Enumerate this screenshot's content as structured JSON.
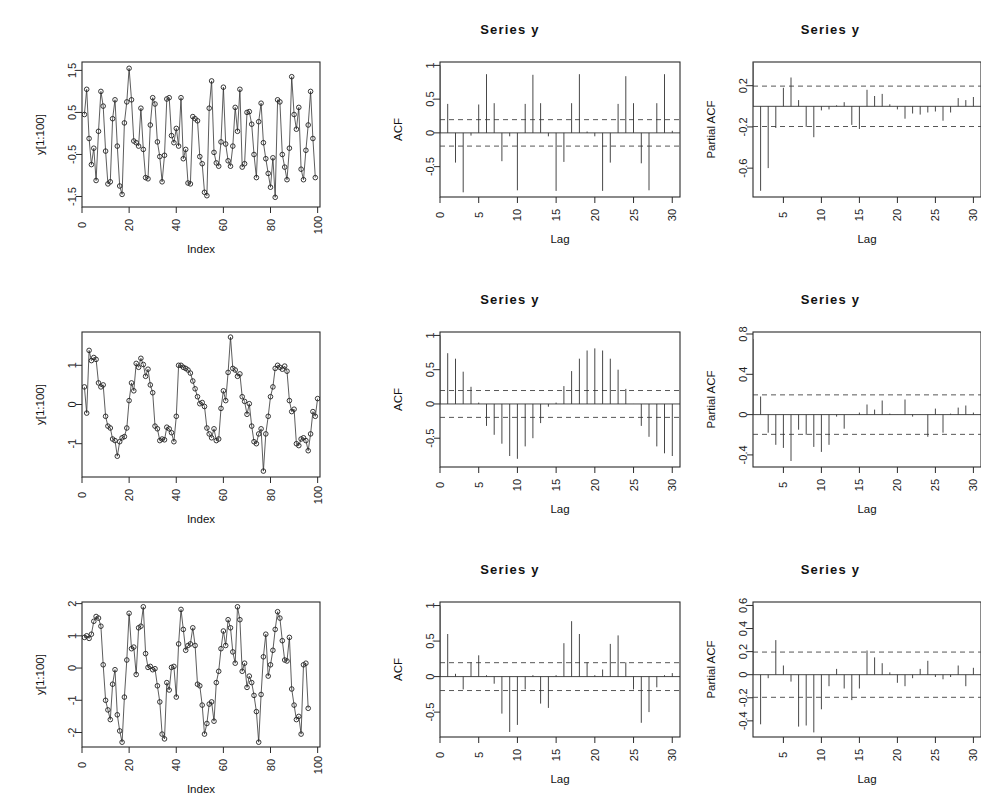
{
  "figure": {
    "layout": "3x3 grid of R base-graphics diagnostic plots",
    "rows": 3,
    "columns": 3,
    "column_roles": [
      "time series",
      "ACF",
      "Partial ACF"
    ]
  },
  "labels": {
    "series_title": "Series  y",
    "xlab_index": "Index",
    "xlab_lag": "Lag",
    "ylab_series": "y[1:100]",
    "ylab_acf": "ACF",
    "ylab_pacf": "Partial ACF"
  },
  "colors": {
    "ink": "#2b2b2b",
    "line": "#333333",
    "confidence": "#444444",
    "background": "#ffffff"
  },
  "chart_data": [
    {
      "id": "row1-series",
      "type": "line",
      "title": "",
      "xlabel": "Index",
      "ylabel": "y[1:100]",
      "xlim": [
        0,
        101
      ],
      "ylim": [
        -1.75,
        1.7
      ],
      "xticks": [
        0,
        20,
        40,
        60,
        80,
        100
      ],
      "yticks": [
        -1.5,
        -0.5,
        0.5,
        1.5
      ],
      "grid": false,
      "markers": "open-circle",
      "x": [
        1,
        2,
        3,
        4,
        5,
        6,
        7,
        8,
        9,
        10,
        11,
        12,
        13,
        14,
        15,
        16,
        17,
        18,
        19,
        20,
        21,
        22,
        23,
        24,
        25,
        26,
        27,
        28,
        29,
        30,
        31,
        32,
        33,
        34,
        35,
        36,
        37,
        38,
        39,
        40,
        41,
        42,
        43,
        44,
        45,
        46,
        47,
        48,
        49,
        50,
        51,
        52,
        53,
        54,
        55,
        56,
        57,
        58,
        59,
        60,
        61,
        62,
        63,
        64,
        65,
        66,
        67,
        68,
        69,
        70,
        71,
        72,
        73,
        74,
        75,
        76,
        77,
        78,
        79,
        80,
        81,
        82,
        83,
        84,
        85,
        86,
        87,
        88,
        89,
        90,
        91,
        92,
        93,
        94,
        95,
        96,
        97,
        98,
        99,
        100
      ],
      "values": [
        0.45,
        1.05,
        -0.12,
        -0.74,
        -0.35,
        -1.12,
        0.05,
        1.0,
        0.65,
        -0.42,
        -1.2,
        -1.15,
        0.35,
        0.8,
        -0.3,
        -1.25,
        -1.45,
        0.25,
        0.75,
        1.55,
        0.8,
        -0.18,
        -0.22,
        -0.3,
        0.6,
        -0.38,
        -1.05,
        -1.08,
        0.2,
        0.85,
        0.7,
        -0.2,
        -0.55,
        -1.15,
        -0.52,
        0.82,
        0.85,
        -0.05,
        -0.22,
        0.12,
        -0.3,
        0.85,
        -0.6,
        -0.38,
        -1.18,
        -1.2,
        0.4,
        0.35,
        0.3,
        -0.55,
        -0.72,
        -1.4,
        -1.48,
        0.6,
        1.25,
        -0.45,
        -0.7,
        -0.78,
        -0.2,
        1.1,
        -0.25,
        -0.65,
        -0.78,
        -0.3,
        0.62,
        0.05,
        1.05,
        -0.8,
        -0.72,
        0.5,
        0.52,
        0.22,
        -0.5,
        -1.05,
        0.28,
        0.72,
        -0.22,
        -0.6,
        -0.95,
        -1.28,
        -0.58,
        -1.52,
        0.8,
        0.75,
        -0.5,
        -0.8,
        -1.1,
        -0.35,
        1.35,
        0.45,
        0.1,
        0.62,
        -0.85,
        -1.1,
        -0.4,
        0.2,
        1.0,
        -0.12,
        -1.05
      ]
    },
    {
      "id": "row1-acf",
      "type": "bar",
      "title": "Series  y",
      "xlabel": "Lag",
      "ylabel": "ACF",
      "xlim": [
        0,
        31
      ],
      "ylim": [
        -0.95,
        1.05
      ],
      "xticks": [
        0,
        5,
        10,
        15,
        20,
        25,
        30
      ],
      "yticks": [
        -0.5,
        0.0,
        0.5,
        1.0
      ],
      "conf_bounds": [
        0.196,
        -0.196
      ],
      "lags": [
        0,
        1,
        2,
        3,
        4,
        5,
        6,
        7,
        8,
        9,
        10,
        11,
        12,
        13,
        14,
        15,
        16,
        17,
        18,
        19,
        20,
        21,
        22,
        23,
        24,
        25,
        26,
        27,
        28,
        29,
        30
      ],
      "values": [
        1.0,
        0.43,
        -0.44,
        -0.88,
        -0.04,
        0.42,
        0.87,
        0.44,
        -0.42,
        -0.05,
        -0.85,
        0.43,
        0.86,
        0.44,
        -0.05,
        -0.86,
        -0.43,
        0.44,
        0.87,
        0.02,
        -0.05,
        -0.86,
        -0.44,
        0.43,
        0.84,
        0.44,
        -0.45,
        -0.85,
        0.44,
        0.87,
        0.03
      ]
    },
    {
      "id": "row1-pacf",
      "type": "bar",
      "title": "Series  y",
      "xlabel": "Lag",
      "ylabel": "Partial ACF",
      "xlim": [
        1,
        31
      ],
      "ylim": [
        -0.88,
        0.43
      ],
      "xticks": [
        0,
        5,
        10,
        15,
        20,
        25,
        30
      ],
      "yticks": [
        -0.6,
        -0.2,
        0.2
      ],
      "conf_bounds": [
        0.196,
        -0.196
      ],
      "lags": [
        1,
        2,
        3,
        4,
        5,
        6,
        7,
        8,
        9,
        10,
        11,
        12,
        13,
        14,
        15,
        16,
        17,
        18,
        19,
        20,
        21,
        22,
        23,
        24,
        25,
        26,
        27,
        28,
        29,
        30
      ],
      "values": [
        0.42,
        -0.82,
        -0.6,
        -0.21,
        0.18,
        0.28,
        0.06,
        -0.2,
        -0.3,
        -0.04,
        -0.03,
        0.01,
        0.04,
        -0.18,
        -0.22,
        0.16,
        0.1,
        0.12,
        0.02,
        -0.03,
        -0.12,
        -0.07,
        -0.08,
        -0.06,
        -0.05,
        -0.14,
        -0.06,
        0.08,
        0.06,
        0.09
      ]
    },
    {
      "id": "row2-series",
      "type": "line",
      "title": "",
      "xlabel": "Index",
      "ylabel": "y[1:100]",
      "xlim": [
        0,
        101
      ],
      "ylim": [
        -1.85,
        1.85
      ],
      "xticks": [
        0,
        20,
        40,
        60,
        80,
        100
      ],
      "yticks": [
        -1,
        0,
        1
      ],
      "grid": false,
      "markers": "open-circle",
      "x": [
        1,
        2,
        3,
        4,
        5,
        6,
        7,
        8,
        9,
        10,
        11,
        12,
        13,
        14,
        15,
        16,
        17,
        18,
        19,
        20,
        21,
        22,
        23,
        24,
        25,
        26,
        27,
        28,
        29,
        30,
        31,
        32,
        33,
        34,
        35,
        36,
        37,
        38,
        39,
        40,
        41,
        42,
        43,
        44,
        45,
        46,
        47,
        48,
        49,
        50,
        51,
        52,
        53,
        54,
        55,
        56,
        57,
        58,
        59,
        60,
        61,
        62,
        63,
        64,
        65,
        66,
        67,
        68,
        69,
        70,
        71,
        72,
        73,
        74,
        75,
        76,
        77,
        78,
        79,
        80,
        81,
        82,
        83,
        84,
        85,
        86,
        87,
        88,
        89,
        90,
        91,
        92,
        93,
        94,
        95,
        96,
        97,
        98,
        99,
        100
      ],
      "values": [
        0.45,
        -0.22,
        1.38,
        1.12,
        1.2,
        1.15,
        0.55,
        0.45,
        0.5,
        -0.3,
        -0.55,
        -0.6,
        -0.88,
        -0.92,
        -1.32,
        -0.95,
        -0.85,
        -0.82,
        -0.6,
        0.1,
        0.55,
        0.35,
        1.05,
        0.95,
        1.18,
        1.02,
        0.72,
        0.9,
        0.5,
        0.3,
        -0.55,
        -0.62,
        -0.92,
        -0.88,
        -0.9,
        -0.58,
        -0.62,
        -0.72,
        -0.95,
        -0.3,
        1.0,
        1.0,
        0.95,
        0.92,
        0.88,
        0.8,
        0.6,
        0.4,
        0.2,
        0.02,
        0.05,
        -0.05,
        -0.6,
        -0.75,
        -0.85,
        -0.62,
        -0.92,
        -0.88,
        -0.1,
        0.35,
        0.1,
        0.82,
        1.72,
        0.92,
        0.88,
        0.72,
        0.78,
        0.2,
        0.08,
        -0.25,
        0.02,
        -0.55,
        -0.95,
        -1.0,
        -0.75,
        -0.62,
        -1.7,
        -0.75,
        -0.3,
        0.2,
        0.45,
        0.92,
        1.0,
        0.95,
        0.9,
        0.98,
        0.85,
        0.1,
        -0.18,
        -0.12,
        -1.0,
        -1.05,
        -0.88,
        -0.85,
        -0.92,
        -1.18,
        -0.75,
        -0.18,
        -0.3,
        0.15
      ]
    },
    {
      "id": "row2-acf",
      "type": "bar",
      "title": "Series  y",
      "xlabel": "Lag",
      "ylabel": "ACF",
      "xlim": [
        0,
        31
      ],
      "ylim": [
        -0.92,
        1.05
      ],
      "xticks": [
        0,
        5,
        10,
        15,
        20,
        25,
        30
      ],
      "yticks": [
        -0.5,
        0.0,
        0.5,
        1.0
      ],
      "conf_bounds": [
        0.196,
        -0.196
      ],
      "lags": [
        0,
        1,
        2,
        3,
        4,
        5,
        6,
        7,
        8,
        9,
        10,
        11,
        12,
        13,
        14,
        15,
        16,
        17,
        18,
        19,
        20,
        21,
        22,
        23,
        24,
        25,
        26,
        27,
        28,
        29,
        30
      ],
      "values": [
        1.0,
        0.74,
        0.66,
        0.47,
        0.25,
        0.02,
        -0.32,
        -0.45,
        -0.58,
        -0.76,
        -0.8,
        -0.62,
        -0.5,
        -0.28,
        -0.04,
        0.02,
        0.26,
        0.48,
        0.66,
        0.78,
        0.81,
        0.78,
        0.66,
        0.5,
        0.22,
        0.0,
        -0.32,
        -0.48,
        -0.62,
        -0.72,
        -0.76
      ]
    },
    {
      "id": "row2-pacf",
      "type": "bar",
      "title": "Series  y",
      "xlabel": "Lag",
      "ylabel": "Partial ACF",
      "xlim": [
        1,
        31
      ],
      "ylim": [
        -0.52,
        0.82
      ],
      "xticks": [
        0,
        5,
        10,
        15,
        20,
        25,
        30
      ],
      "yticks": [
        -0.4,
        0.0,
        0.4,
        0.8
      ],
      "conf_bounds": [
        0.196,
        -0.196
      ],
      "lags": [
        1,
        2,
        3,
        4,
        5,
        6,
        7,
        8,
        9,
        10,
        11,
        12,
        13,
        14,
        15,
        16,
        17,
        18,
        19,
        20,
        21,
        22,
        23,
        24,
        25,
        26,
        27,
        28,
        29,
        30
      ],
      "values": [
        0.75,
        0.18,
        -0.18,
        -0.3,
        -0.33,
        -0.46,
        -0.15,
        -0.2,
        -0.32,
        -0.37,
        -0.3,
        -0.02,
        -0.14,
        0.0,
        0.02,
        0.1,
        0.05,
        0.14,
        0.01,
        0.0,
        0.15,
        -0.02,
        0.0,
        -0.22,
        0.06,
        -0.18,
        0.01,
        0.07,
        0.09,
        0.02
      ]
    },
    {
      "id": "row3-series",
      "type": "line",
      "title": "",
      "xlabel": "Index",
      "ylabel": "y[1:100]",
      "xlim": [
        0,
        101
      ],
      "ylim": [
        -2.45,
        2.05
      ],
      "xticks": [
        0,
        20,
        40,
        60,
        80,
        100
      ],
      "yticks": [
        -2,
        -1,
        0,
        1,
        2
      ],
      "grid": false,
      "markers": "open-circle",
      "x": [
        1,
        2,
        3,
        4,
        5,
        6,
        7,
        8,
        9,
        10,
        11,
        12,
        13,
        14,
        15,
        16,
        17,
        18,
        19,
        20,
        21,
        22,
        23,
        24,
        25,
        26,
        27,
        28,
        29,
        30,
        31,
        32,
        33,
        34,
        35,
        36,
        37,
        38,
        39,
        40,
        41,
        42,
        43,
        44,
        45,
        46,
        47,
        48,
        49,
        50,
        51,
        52,
        53,
        54,
        55,
        56,
        57,
        58,
        59,
        60,
        61,
        62,
        63,
        64,
        65,
        66,
        67,
        68,
        69,
        70,
        71,
        72,
        73,
        74,
        75,
        76,
        77,
        78,
        79,
        80,
        81,
        82,
        83,
        84,
        85,
        86,
        87,
        88,
        89,
        90,
        91,
        92,
        93,
        94,
        95,
        96,
        97,
        98,
        99,
        100
      ],
      "values": [
        0.95,
        1.0,
        0.92,
        1.05,
        1.45,
        1.6,
        1.55,
        1.3,
        0.1,
        -1.0,
        -1.3,
        -1.6,
        -0.5,
        -0.05,
        -1.45,
        -1.95,
        -2.3,
        -0.9,
        0.25,
        1.7,
        0.6,
        0.65,
        -0.2,
        1.25,
        1.3,
        1.9,
        0.45,
        0.02,
        0.05,
        -0.05,
        -0.02,
        -0.55,
        -1.05,
        -2.05,
        -2.2,
        -0.45,
        -0.68,
        0.02,
        0.05,
        -0.9,
        0.75,
        1.82,
        1.2,
        0.55,
        0.7,
        0.75,
        1.25,
        0.7,
        -0.5,
        -0.55,
        -1.15,
        -2.05,
        -1.72,
        -1.12,
        -1.05,
        -1.65,
        -0.45,
        -0.1,
        0.6,
        1.15,
        0.7,
        1.5,
        1.25,
        0.5,
        0.15,
        1.9,
        1.5,
        -0.1,
        0.15,
        -0.6,
        -0.25,
        -0.45,
        -0.85,
        -1.35,
        -2.3,
        -0.82,
        0.35,
        1.05,
        -0.25,
        0.1,
        0.55,
        1.2,
        1.75,
        1.55,
        0.85,
        0.25,
        0.22,
        0.95,
        -0.65,
        -1.15,
        -1.6,
        -1.5,
        -2.05,
        0.1,
        0.15,
        -1.25
      ]
    },
    {
      "id": "row3-acf",
      "type": "bar",
      "title": "Series  y",
      "xlabel": "Lag",
      "ylabel": "ACF",
      "xlim": [
        0,
        31
      ],
      "ylim": [
        -0.85,
        1.05
      ],
      "xticks": [
        0,
        5,
        10,
        15,
        20,
        25,
        30
      ],
      "yticks": [
        -0.5,
        0.0,
        0.5,
        1.0
      ],
      "conf_bounds": [
        0.196,
        -0.196
      ],
      "lags": [
        0,
        1,
        2,
        3,
        4,
        5,
        6,
        7,
        8,
        9,
        10,
        11,
        12,
        13,
        14,
        15,
        16,
        17,
        18,
        19,
        20,
        21,
        22,
        23,
        24,
        25,
        26,
        27,
        28,
        29,
        30
      ],
      "values": [
        1.0,
        0.6,
        0.04,
        -0.18,
        0.2,
        0.3,
        0.02,
        -0.1,
        -0.52,
        -0.78,
        -0.68,
        -0.18,
        0.02,
        -0.38,
        -0.44,
        0.02,
        0.47,
        0.78,
        0.6,
        0.2,
        0.02,
        0.1,
        0.46,
        0.58,
        0.2,
        -0.18,
        -0.65,
        -0.5,
        -0.15,
        0.02,
        0.05
      ]
    },
    {
      "id": "row3-pacf",
      "type": "bar",
      "title": "Series  y",
      "xlabel": "Lag",
      "ylabel": "Partial ACF",
      "xlim": [
        1,
        31
      ],
      "ylim": [
        -0.54,
        0.63
      ],
      "xticks": [
        0,
        5,
        10,
        15,
        20,
        25,
        30
      ],
      "yticks": [
        -0.4,
        -0.2,
        0.0,
        0.2,
        0.4,
        0.6
      ],
      "conf_bounds": [
        0.196,
        -0.196
      ],
      "lags": [
        1,
        2,
        3,
        4,
        5,
        6,
        7,
        8,
        9,
        10,
        11,
        12,
        13,
        14,
        15,
        16,
        17,
        18,
        19,
        20,
        21,
        22,
        23,
        24,
        25,
        26,
        27,
        28,
        29,
        30
      ],
      "values": [
        0.6,
        -0.43,
        -0.03,
        0.3,
        0.08,
        -0.06,
        -0.45,
        -0.44,
        -0.5,
        -0.3,
        -0.1,
        0.05,
        -0.12,
        -0.22,
        -0.12,
        0.21,
        0.15,
        0.1,
        0.02,
        -0.07,
        -0.1,
        -0.03,
        0.05,
        0.12,
        -0.02,
        -0.04,
        -0.02,
        0.08,
        -0.1,
        0.06
      ]
    }
  ]
}
